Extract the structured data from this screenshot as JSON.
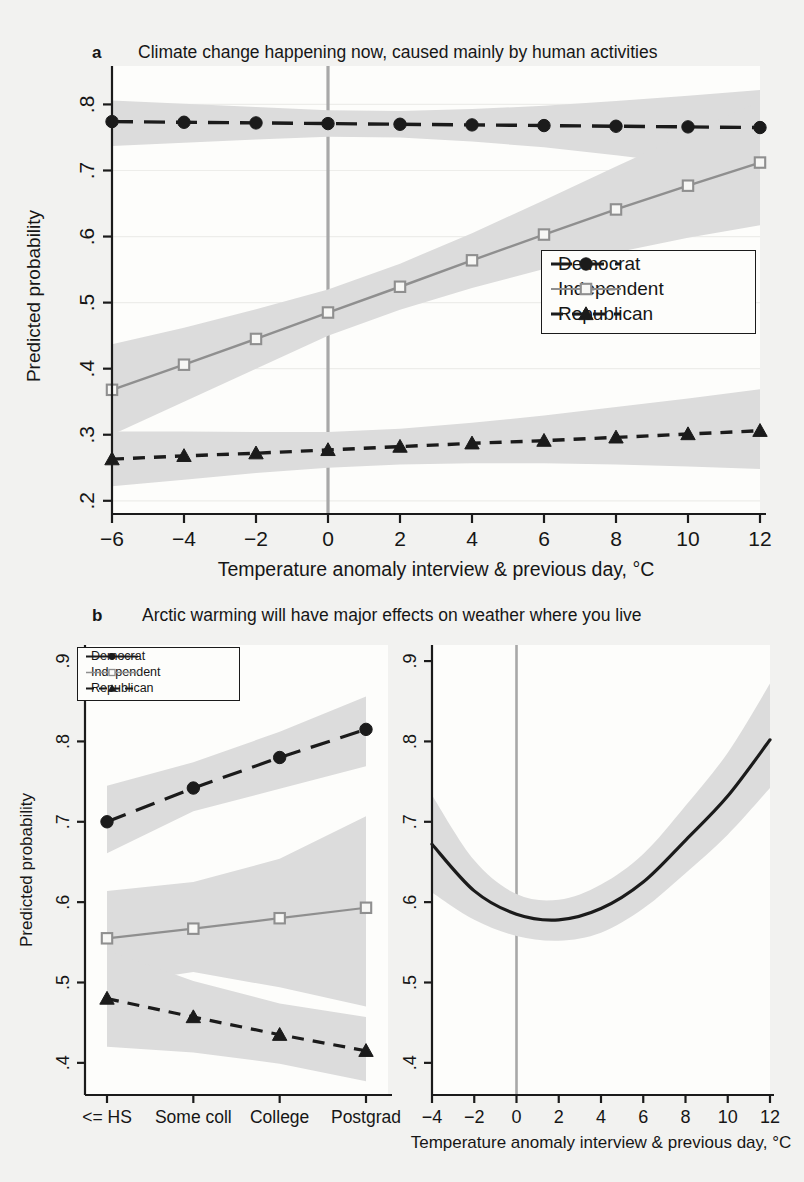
{
  "figure": {
    "background_color": "#f2f2f0",
    "band_color": "#dcdcdc",
    "ref_line_color": "#a8a8a8"
  },
  "panel_a": {
    "letter": "a",
    "title": "Climate change happening now, caused mainly by human activities",
    "ylabel": "Predicted probability",
    "xlabel": "Temperature anomaly interview & previous day, °C",
    "y_ticks": [
      ".8",
      ".7",
      ".6",
      ".5",
      ".4",
      ".3",
      ".2"
    ],
    "x_ticks": [
      "−6",
      "−4",
      "−2",
      "0",
      "2",
      "4",
      "6",
      "8",
      "10",
      "12"
    ],
    "legend": [
      {
        "label": "Democrat",
        "marker": "filled-circle",
        "dash": "long-dash",
        "color": "#1b1b1b"
      },
      {
        "label": "Independent",
        "marker": "open-square",
        "dash": "solid",
        "color": "#8f8f8f"
      },
      {
        "label": "Republican",
        "marker": "filled-triangle",
        "dash": "dash",
        "color": "#1b1b1b"
      }
    ]
  },
  "panel_b": {
    "letter": "b",
    "title": "Arctic warming will have major effects on weather where you live",
    "ylabel": "Predicted probability",
    "y_ticks": [
      ".9",
      ".8",
      ".7",
      ".6",
      ".5",
      ".4"
    ],
    "left_x_ticks": [
      "<= HS",
      "Some coll",
      "College",
      "Postgrad"
    ],
    "right_x_ticks": [
      "−4",
      "−2",
      "0",
      "2",
      "4",
      "6",
      "8",
      "10",
      "12"
    ],
    "right_xlabel": "Temperature anomaly interview & previous day, °C",
    "legend": [
      {
        "label": "Democrat",
        "marker": "filled-circle",
        "dash": "solid",
        "color": "#1b1b1b"
      },
      {
        "label": "Independent",
        "marker": "open-square",
        "dash": "solid",
        "color": "#8f8f8f"
      },
      {
        "label": "Republican",
        "marker": "filled-triangle",
        "dash": "dash",
        "color": "#1b1b1b"
      }
    ]
  },
  "chart_data": [
    {
      "id": "panel_a",
      "type": "line",
      "title": "Climate change happening now, caused mainly by human activities",
      "xlabel": "Temperature anomaly interview & previous day, °C",
      "ylabel": "Predicted probability",
      "xlim": [
        -6,
        12
      ],
      "ylim": [
        0.18,
        0.84
      ],
      "ytick_values": [
        0.8,
        0.7,
        0.6,
        0.5,
        0.4,
        0.3,
        0.2
      ],
      "xtick_values": [
        -6,
        -4,
        -2,
        0,
        2,
        4,
        6,
        8,
        10,
        12
      ],
      "grid": "faint-horizontal",
      "reference_line_x": 0,
      "legend_position": "center-right",
      "x": [
        -6,
        -4,
        -2,
        0,
        2,
        4,
        6,
        8,
        10,
        12
      ],
      "series": [
        {
          "name": "Democrat",
          "values": [
            0.774,
            0.773,
            0.772,
            0.771,
            0.77,
            0.769,
            0.768,
            0.767,
            0.766,
            0.765
          ],
          "ci_low": [
            0.737,
            0.742,
            0.747,
            0.751,
            0.75,
            0.744,
            0.735,
            0.723,
            0.71,
            0.697
          ],
          "ci_high": [
            0.806,
            0.801,
            0.796,
            0.791,
            0.79,
            0.793,
            0.798,
            0.805,
            0.813,
            0.822
          ]
        },
        {
          "name": "Independent",
          "values": [
            0.368,
            0.406,
            0.445,
            0.485,
            0.524,
            0.564,
            0.603,
            0.641,
            0.677,
            0.712
          ],
          "ci_low": [
            0.3,
            0.35,
            0.4,
            0.45,
            0.489,
            0.522,
            0.551,
            0.576,
            0.598,
            0.617
          ],
          "ci_high": [
            0.437,
            0.462,
            0.49,
            0.52,
            0.559,
            0.605,
            0.655,
            0.706,
            0.756,
            0.804
          ]
        },
        {
          "name": "Republican",
          "values": [
            0.263,
            0.268,
            0.272,
            0.277,
            0.282,
            0.287,
            0.291,
            0.296,
            0.301,
            0.306
          ],
          "ci_low": [
            0.222,
            0.232,
            0.242,
            0.25,
            0.255,
            0.257,
            0.257,
            0.255,
            0.252,
            0.248
          ],
          "ci_high": [
            0.305,
            0.305,
            0.304,
            0.304,
            0.309,
            0.318,
            0.329,
            0.342,
            0.355,
            0.369
          ]
        }
      ]
    },
    {
      "id": "panel_b_left",
      "type": "line",
      "title": "Arctic warming will have major effects on weather where you live",
      "xlabel": "",
      "ylabel": "Predicted probability",
      "categories": [
        "<= HS",
        "Some coll",
        "College",
        "Postgrad"
      ],
      "ylim": [
        0.36,
        0.92
      ],
      "ytick_values": [
        0.9,
        0.8,
        0.7,
        0.6,
        0.5,
        0.4
      ],
      "grid": "none",
      "legend_position": "top-left",
      "series": [
        {
          "name": "Democrat",
          "values": [
            0.7,
            0.742,
            0.78,
            0.815
          ],
          "ci_low": [
            0.661,
            0.713,
            0.741,
            0.769
          ],
          "ci_high": [
            0.745,
            0.774,
            0.812,
            0.856
          ]
        },
        {
          "name": "Independent",
          "values": [
            0.555,
            0.567,
            0.58,
            0.593
          ],
          "ci_low": [
            0.497,
            0.513,
            0.494,
            0.47
          ],
          "ci_high": [
            0.614,
            0.625,
            0.654,
            0.707
          ]
        },
        {
          "name": "Republican",
          "values": [
            0.48,
            0.457,
            0.435,
            0.415
          ],
          "ci_low": [
            0.42,
            0.413,
            0.399,
            0.377
          ],
          "ci_high": [
            0.54,
            0.502,
            0.474,
            0.457
          ]
        }
      ]
    },
    {
      "id": "panel_b_right",
      "type": "line",
      "title": "",
      "xlabel": "Temperature anomaly interview & previous day, °C",
      "ylabel": "",
      "xlim": [
        -4,
        12
      ],
      "ylim": [
        0.36,
        0.92
      ],
      "ytick_values": [
        0.9,
        0.8,
        0.7,
        0.6,
        0.5,
        0.4
      ],
      "xtick_values": [
        -4,
        -2,
        0,
        2,
        4,
        6,
        8,
        10,
        12
      ],
      "grid": "none",
      "reference_line_x": 0,
      "legend_position": "none",
      "x": [
        -4,
        -2,
        0,
        2,
        4,
        6,
        8,
        10,
        12
      ],
      "series": [
        {
          "name": "All respondents",
          "values": [
            0.672,
            0.614,
            0.585,
            0.578,
            0.592,
            0.625,
            0.677,
            0.732,
            0.802
          ],
          "ci_low": [
            0.612,
            0.578,
            0.558,
            0.552,
            0.562,
            0.592,
            0.636,
            0.684,
            0.742
          ],
          "ci_high": [
            0.733,
            0.652,
            0.61,
            0.603,
            0.622,
            0.66,
            0.72,
            0.786,
            0.872
          ]
        }
      ]
    }
  ]
}
